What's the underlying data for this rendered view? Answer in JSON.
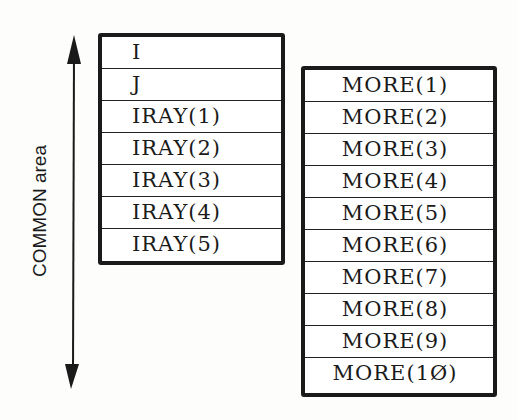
{
  "axis_label": "COMMON area",
  "left_block": {
    "cells": [
      "I",
      "J",
      "IRAY(1)",
      "IRAY(2)",
      "IRAY(3)",
      "IRAY(4)",
      "IRAY(5)"
    ]
  },
  "right_block": {
    "cells": [
      "MORE(1)",
      "MORE(2)",
      "MORE(3)",
      "MORE(4)",
      "MORE(5)",
      "MORE(6)",
      "MORE(7)",
      "MORE(8)",
      "MORE(9)",
      "MORE(1Ø)"
    ]
  }
}
